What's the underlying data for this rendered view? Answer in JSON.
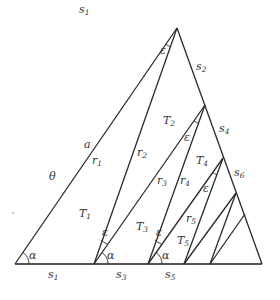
{
  "figure": {
    "type": "geometric-construction",
    "colors": {
      "line": "#2a2a2a",
      "baseline": "#555555",
      "text": "#333333",
      "background": "#ffffff"
    }
  },
  "labels": {
    "s1_top": {
      "base": "s",
      "sub": "1"
    },
    "s1_bottom": {
      "base": "s",
      "sub": "1"
    },
    "s2": {
      "base": "s",
      "sub": "2"
    },
    "s3": {
      "base": "s",
      "sub": "3"
    },
    "s4": {
      "base": "s",
      "sub": "4"
    },
    "s5": {
      "base": "s",
      "sub": "5"
    },
    "s6": {
      "base": "s",
      "sub": "6"
    },
    "a": "a",
    "theta": "θ",
    "r1": {
      "base": "r",
      "sub": "1"
    },
    "r2": {
      "base": "r",
      "sub": "2"
    },
    "r3": {
      "base": "r",
      "sub": "3"
    },
    "r4": {
      "base": "r",
      "sub": "4"
    },
    "r5": {
      "base": "r",
      "sub": "5"
    },
    "T1": {
      "base": "T",
      "sub": "1"
    },
    "T2": {
      "base": "T",
      "sub": "2"
    },
    "T3": {
      "base": "T",
      "sub": "3"
    },
    "T4": {
      "base": "T",
      "sub": "4"
    },
    "T5": {
      "base": "T",
      "sub": "5"
    },
    "alpha": "α",
    "epsilon": "ε"
  }
}
